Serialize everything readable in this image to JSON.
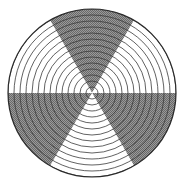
{
  "figure": {
    "canvas": {
      "width": 184,
      "height": 191,
      "background": "#ffffff"
    }
  },
  "chart_data": {
    "type": "pie",
    "subtitle": "",
    "xlabel": "",
    "ylabel": "",
    "legend_position": "none",
    "grid": true,
    "center": {
      "x": 92,
      "y": 93
    },
    "radius_x": 84,
    "radius_y": 84,
    "sector_count": 6,
    "sector_sweep_degrees": 60,
    "start_angle_degrees": -90,
    "categories": [
      "S1",
      "S2",
      "S3",
      "S4",
      "S5",
      "S6"
    ],
    "values": [
      60,
      60,
      60,
      60,
      60,
      60
    ],
    "slice_fills": [
      "gray",
      "white",
      "gray",
      "white",
      "gray",
      "white"
    ],
    "slice_colors": [
      "#808080",
      "#ffffff",
      "#808080",
      "#ffffff",
      "#808080",
      "#ffffff"
    ],
    "sectors": [
      {
        "label": "S1",
        "start_deg": -120,
        "end_deg": -60,
        "fill": "gray",
        "color": "#808080"
      },
      {
        "label": "S2",
        "start_deg": -60,
        "end_deg": 0,
        "fill": "white",
        "color": "#ffffff"
      },
      {
        "label": "S3",
        "start_deg": 0,
        "end_deg": 60,
        "fill": "gray",
        "color": "#808080"
      },
      {
        "label": "S4",
        "start_deg": 60,
        "end_deg": 120,
        "fill": "white",
        "color": "#ffffff"
      },
      {
        "label": "S5",
        "start_deg": 120,
        "end_deg": 180,
        "fill": "gray",
        "color": "#808080"
      },
      {
        "label": "S6",
        "start_deg": 180,
        "end_deg": 240,
        "fill": "white",
        "color": "#ffffff"
      }
    ],
    "rings": {
      "count": 14,
      "radii": [
        6,
        12,
        18,
        24,
        30,
        36,
        42,
        48,
        54,
        60,
        66,
        72,
        78,
        84
      ],
      "stroke": "#3a3a3a",
      "stroke_width": 0.8
    },
    "outline": {
      "stroke": "#2b2b2b",
      "stroke_width": 1.2
    },
    "colors": {
      "gray_fill": "#808080",
      "white_fill": "#ffffff",
      "ring_stroke": "#3a3a3a",
      "outline_stroke": "#2b2b2b",
      "background": "#ffffff"
    }
  }
}
